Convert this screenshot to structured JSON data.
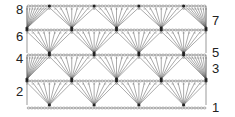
{
  "diagram": {
    "type": "crochet-stitch-chart",
    "foundation": "chain row",
    "row_labels": {
      "left": [
        {
          "label": "8",
          "x": 16,
          "y": 3
        },
        {
          "label": "6",
          "x": 16,
          "y": 30
        },
        {
          "label": "4",
          "x": 16,
          "y": 52
        },
        {
          "label": "2",
          "x": 16,
          "y": 85
        }
      ],
      "right": [
        {
          "label": "7",
          "x": 212,
          "y": 14
        },
        {
          "label": "5",
          "x": 212,
          "y": 46
        },
        {
          "label": "3",
          "x": 212,
          "y": 62
        },
        {
          "label": "1",
          "x": 212,
          "y": 101
        }
      ]
    },
    "grid": {
      "left": 27,
      "right": 206,
      "bands": [
        {
          "top": 6,
          "bottom": 28,
          "rows": "7-8"
        },
        {
          "top": 30,
          "bottom": 53,
          "rows": "5-6"
        },
        {
          "top": 55,
          "bottom": 79,
          "rows": "3-4"
        },
        {
          "top": 81,
          "bottom": 105,
          "rows": "1-2"
        }
      ],
      "foundation_y": 108
    },
    "colors": {
      "line": "#555555",
      "text": "#222222",
      "background": "#ffffff"
    }
  }
}
